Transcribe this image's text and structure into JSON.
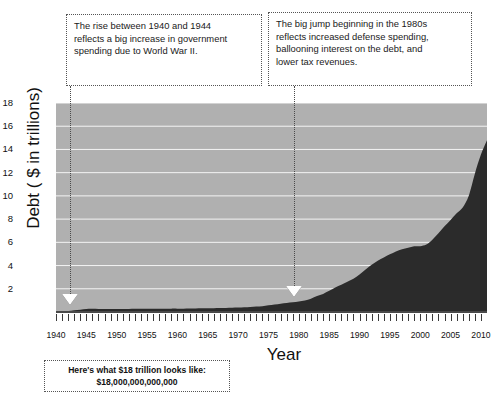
{
  "chart_data": {
    "type": "area",
    "title": "",
    "xlabel": "Year",
    "ylabel": "Debt ( $ in trillions)",
    "xlim": [
      1940,
      2011
    ],
    "ylim": [
      0,
      18
    ],
    "grid": true,
    "legend": "none",
    "series_name": "U.S. National Debt",
    "x": [
      1940,
      1941,
      1942,
      1943,
      1944,
      1945,
      1946,
      1947,
      1948,
      1949,
      1950,
      1951,
      1952,
      1953,
      1954,
      1955,
      1956,
      1957,
      1958,
      1959,
      1960,
      1961,
      1962,
      1963,
      1964,
      1965,
      1966,
      1967,
      1968,
      1969,
      1970,
      1971,
      1972,
      1973,
      1974,
      1975,
      1976,
      1977,
      1978,
      1979,
      1980,
      1981,
      1982,
      1983,
      1984,
      1985,
      1986,
      1987,
      1988,
      1989,
      1990,
      1991,
      1992,
      1993,
      1994,
      1995,
      1996,
      1997,
      1998,
      1999,
      2000,
      2001,
      2002,
      2003,
      2004,
      2005,
      2006,
      2007,
      2008,
      2009,
      2010,
      2011
    ],
    "values": [
      0.05,
      0.06,
      0.08,
      0.14,
      0.2,
      0.26,
      0.27,
      0.26,
      0.25,
      0.25,
      0.26,
      0.26,
      0.26,
      0.27,
      0.27,
      0.27,
      0.27,
      0.27,
      0.28,
      0.29,
      0.29,
      0.29,
      0.3,
      0.31,
      0.32,
      0.32,
      0.33,
      0.34,
      0.35,
      0.37,
      0.38,
      0.41,
      0.44,
      0.47,
      0.49,
      0.58,
      0.65,
      0.72,
      0.78,
      0.83,
      0.91,
      1.0,
      1.14,
      1.37,
      1.56,
      1.82,
      2.12,
      2.35,
      2.6,
      2.86,
      3.23,
      3.67,
      4.06,
      4.41,
      4.69,
      4.97,
      5.22,
      5.41,
      5.53,
      5.66,
      5.67,
      5.81,
      6.23,
      6.78,
      7.38,
      7.93,
      8.51,
      9.01,
      10.02,
      11.91,
      13.56,
      14.79
    ],
    "y_ticks": [
      2,
      4,
      6,
      8,
      10,
      12,
      14,
      16,
      18
    ],
    "x_tick_labels": [
      1940,
      1945,
      1950,
      1955,
      1960,
      1965,
      1970,
      1975,
      1980,
      1985,
      1990,
      1995,
      2000,
      2005,
      2010
    ],
    "colors": {
      "plot_background": "#b0b0b0",
      "area_fill": "#2b2b2b",
      "gridline": "#ffffff",
      "axis": "#4a4a4a",
      "text": "#111111",
      "marker_fill": "#ffffff"
    },
    "annotations": [
      {
        "name": "wwii",
        "lines": [
          "The rise between 1940 and 1944",
          "reflects a big increase in government",
          "spending due to World War II."
        ],
        "points_to_year": 1941
      },
      {
        "name": "eighties",
        "lines": [
          "The big jump beginning in the 1980s",
          "reflects increased defense spending,",
          "ballooning interest on the debt, and",
          "lower tax revenues."
        ],
        "points_to_year": 1980
      }
    ],
    "caption": {
      "line1": "Here's what $18 trillion looks like:",
      "line2": "$18,000,000,000,000"
    }
  }
}
